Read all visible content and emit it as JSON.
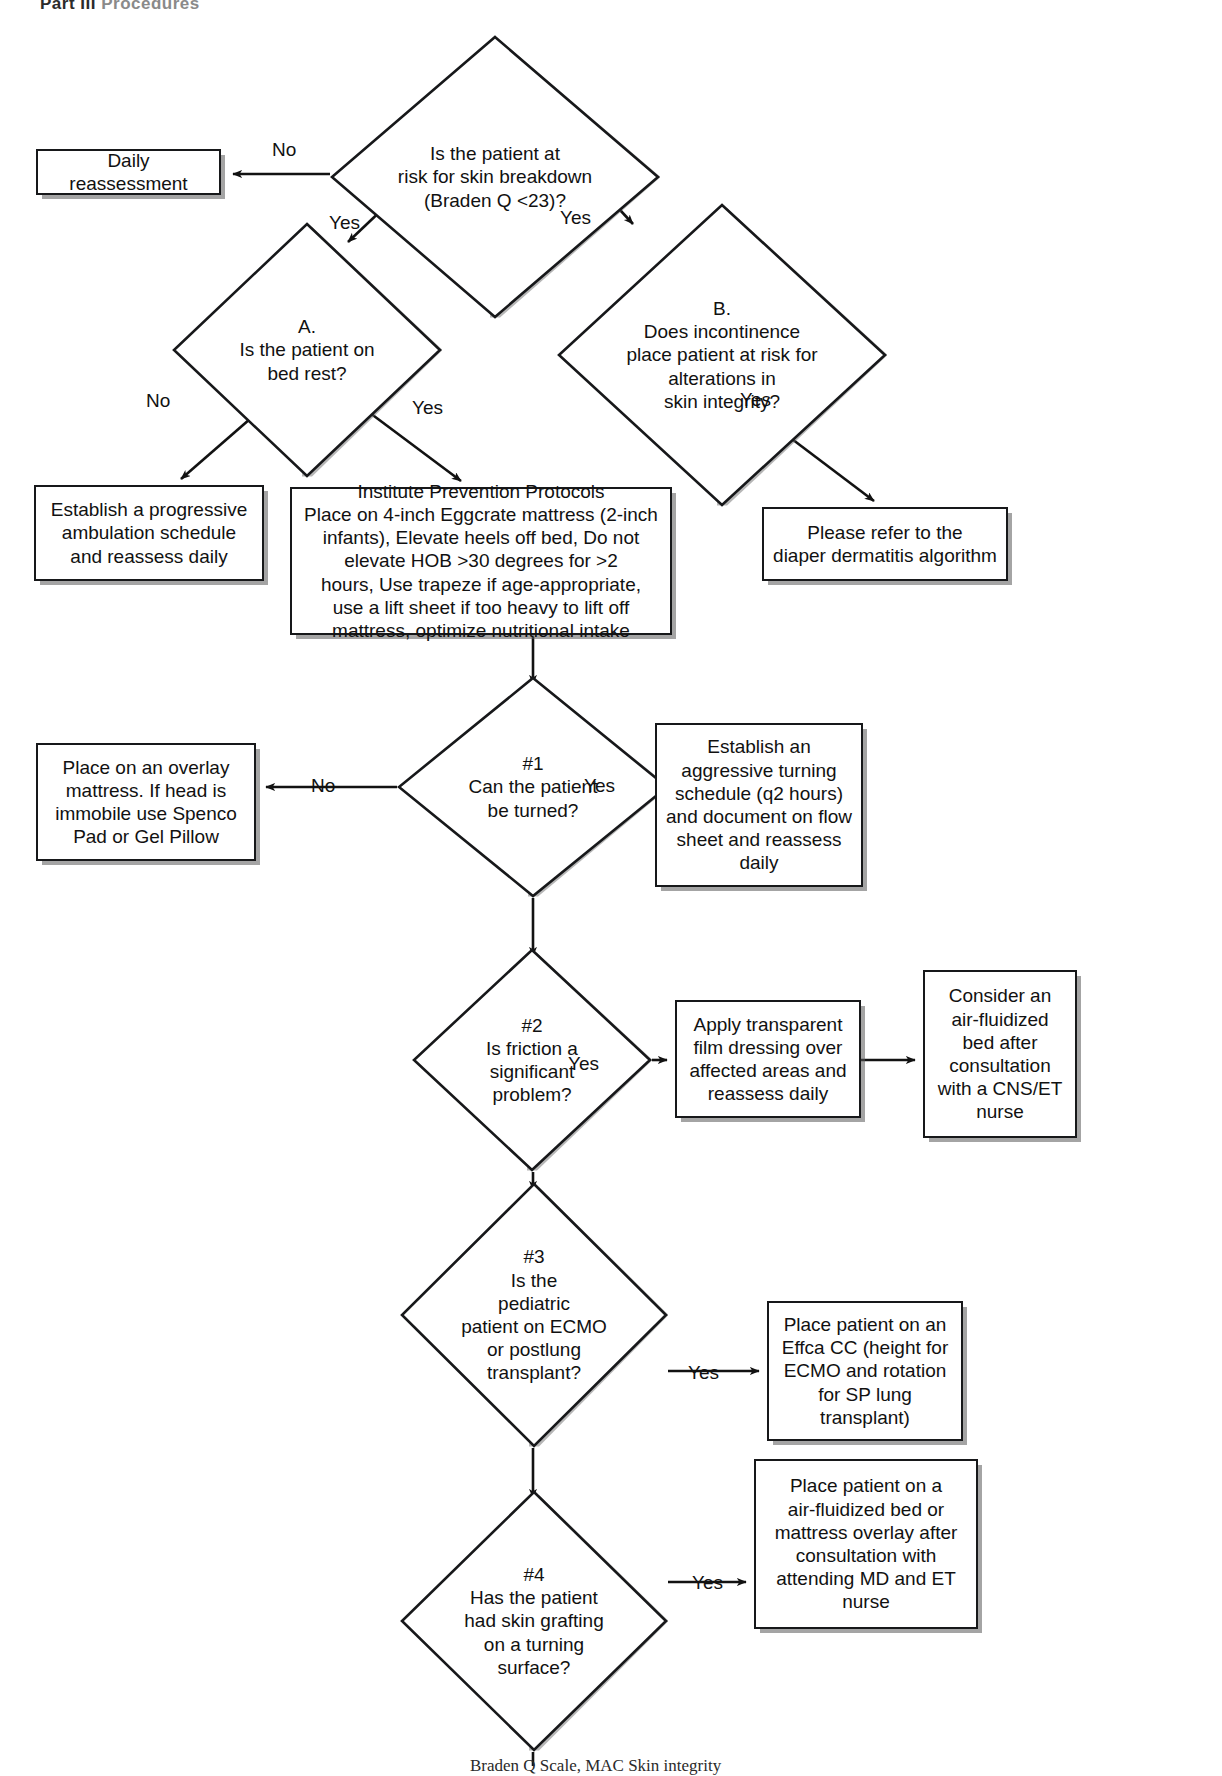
{
  "page": {
    "header_part": "Part III",
    "header_sub": "Procedures",
    "caption": "Braden Q Scale, MAC Skin integrity"
  },
  "diagram": {
    "nodes": [
      {
        "id": "daily-reassessment",
        "type": "box",
        "label": "Daily reassessment",
        "x": 36,
        "y": 149,
        "w": 185,
        "h": 46,
        "font": 19
      },
      {
        "id": "risk-decision",
        "type": "diamond",
        "label": "Is the patient at\nrisk for skin breakdown\n(Braden Q <23)?",
        "x": 330,
        "y": 35,
        "w": 330,
        "h": 284,
        "font": 19
      },
      {
        "id": "bedrest-decision",
        "type": "diamond",
        "label": "A.\nIs the patient on\nbed rest?",
        "x": 172,
        "y": 222,
        "w": 270,
        "h": 256,
        "font": 19
      },
      {
        "id": "incontinence-decision",
        "type": "diamond",
        "label": "B.\nDoes incontinence\nplace patient at risk for\nalterations in\nskin integrity?",
        "x": 557,
        "y": 203,
        "w": 330,
        "h": 304,
        "font": 19
      },
      {
        "id": "ambulation-box",
        "type": "box",
        "label": "Establish a progressive\nambulation schedule\nand reassess daily",
        "x": 34,
        "y": 485,
        "w": 230,
        "h": 96,
        "font": 19
      },
      {
        "id": "prevention-protocol-box",
        "type": "box",
        "label": "Institute Prevention Protocols\nPlace on 4-inch Eggcrate mattress (2-inch\ninfants), Elevate heels off bed, Do not\nelevate HOB >30 degrees for >2\nhours, Use trapeze if age-appropriate,\nuse a lift sheet if too heavy to lift off\nmattress, optimize nutritional intake",
        "x": 290,
        "y": 487,
        "w": 382,
        "h": 148,
        "font": 19
      },
      {
        "id": "diaper-dermatitis-box",
        "type": "box",
        "label": "Please refer to the\ndiaper dermatitis algorithm",
        "x": 762,
        "y": 507,
        "w": 246,
        "h": 74,
        "font": 19
      },
      {
        "id": "turn-decision",
        "type": "diamond",
        "label": "#1\nCan the patient\nbe turned?",
        "x": 397,
        "y": 676,
        "w": 272,
        "h": 222,
        "font": 19
      },
      {
        "id": "overlay-mattress-box",
        "type": "box",
        "label": "Place on an overlay\nmattress. If head is\nimmobile use Spenco\nPad or Gel Pillow",
        "x": 36,
        "y": 743,
        "w": 220,
        "h": 118,
        "font": 19
      },
      {
        "id": "turning-schedule-box",
        "type": "box",
        "label": "Establish an\naggressive turning\nschedule (q2 hours)\nand document on flow\nsheet and reassess\ndaily",
        "x": 655,
        "y": 723,
        "w": 208,
        "h": 164,
        "font": 19
      },
      {
        "id": "friction-decision",
        "type": "diamond",
        "label": "#2\nIs friction a\nsignificant\nproblem?",
        "x": 412,
        "y": 948,
        "w": 240,
        "h": 224,
        "font": 19
      },
      {
        "id": "film-dressing-box",
        "type": "box",
        "label": "Apply transparent\nfilm dressing over\naffected areas and\nreassess daily",
        "x": 675,
        "y": 1000,
        "w": 186,
        "h": 118,
        "font": 19
      },
      {
        "id": "air-fluidized-box",
        "type": "box",
        "label": "Consider an\nair-fluidized\nbed after\nconsultation\nwith a CNS/ET\nnurse",
        "x": 923,
        "y": 970,
        "w": 154,
        "h": 168,
        "font": 19
      },
      {
        "id": "ecmo-decision",
        "type": "diamond",
        "label": "#3\nIs the\npediatric\npatient on ECMO\nor postlung\ntransplant?",
        "x": 400,
        "y": 1182,
        "w": 268,
        "h": 266,
        "font": 19
      },
      {
        "id": "effca-cc-box",
        "type": "box",
        "label": "Place patient on an\nEffca CC (height for\nECMO and rotation\nfor SP lung\ntransplant)",
        "x": 767,
        "y": 1301,
        "w": 196,
        "h": 140,
        "font": 19
      },
      {
        "id": "skin-graft-decision",
        "type": "diamond",
        "label": "#4\nHas the patient\nhad skin grafting\non a turning\nsurface?",
        "x": 400,
        "y": 1490,
        "w": 268,
        "h": 262,
        "font": 19
      },
      {
        "id": "air-fluidized-overlay-box",
        "type": "box",
        "label": "Place patient on a\nair-fluidized bed or\nmattress overlay after\nconsultation with\nattending MD and ET\nnurse",
        "x": 754,
        "y": 1459,
        "w": 224,
        "h": 170,
        "font": 19
      }
    ],
    "edge_labels": [
      {
        "id": "lbl-risk-no",
        "text": "No",
        "x": 272,
        "y": 140
      },
      {
        "id": "lbl-risk-yes-left",
        "text": "Yes",
        "x": 329,
        "y": 213
      },
      {
        "id": "lbl-risk-yes-right",
        "text": "Yes",
        "x": 560,
        "y": 208
      },
      {
        "id": "lbl-bedrest-no",
        "text": "No",
        "x": 146,
        "y": 391
      },
      {
        "id": "lbl-bedrest-yes",
        "text": "Yes",
        "x": 412,
        "y": 398
      },
      {
        "id": "lbl-incont-yes",
        "text": "Yes",
        "x": 740,
        "y": 390
      },
      {
        "id": "lbl-turn-no",
        "text": "No",
        "x": 311,
        "y": 776
      },
      {
        "id": "lbl-turn-yes",
        "text": "Yes",
        "x": 584,
        "y": 776
      },
      {
        "id": "lbl-friction-yes",
        "text": "Yes",
        "x": 568,
        "y": 1054
      },
      {
        "id": "lbl-ecmo-yes",
        "text": "Yes",
        "x": 688,
        "y": 1363
      },
      {
        "id": "lbl-graft-yes",
        "text": "Yes",
        "x": 692,
        "y": 1573
      }
    ]
  }
}
